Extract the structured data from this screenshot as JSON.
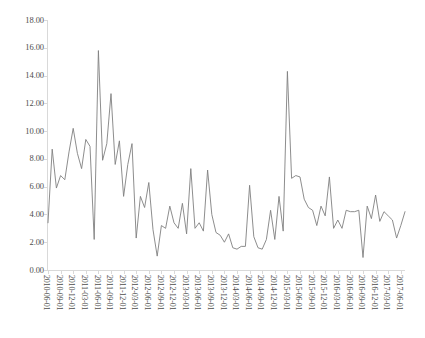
{
  "chart_data": {
    "type": "line",
    "title": "",
    "xlabel": "",
    "ylabel": "",
    "ylim": [
      0,
      18
    ],
    "ytick_step": 2,
    "ytick_labels": [
      "0.00",
      "2.00",
      "4.00",
      "6.00",
      "8.00",
      "10.00",
      "12.00",
      "14.00",
      "16.00",
      "18.00"
    ],
    "grid": false,
    "legend": "none",
    "line_color": "#808080",
    "axis_color": "#d9d9d9",
    "label_color": "#4d4d4d",
    "xtick_rotation": 90,
    "xtick_interval_months": 3,
    "x": [
      "2010-06-01",
      "2010-07-01",
      "2010-08-01",
      "2010-09-01",
      "2010-10-01",
      "2010-11-01",
      "2010-12-01",
      "2011-01-01",
      "2011-02-01",
      "2011-03-01",
      "2011-04-01",
      "2011-05-01",
      "2011-06-01",
      "2011-07-01",
      "2011-08-01",
      "2011-09-01",
      "2011-10-01",
      "2011-11-01",
      "2011-12-01",
      "2012-01-01",
      "2012-02-01",
      "2012-03-01",
      "2012-04-01",
      "2012-05-01",
      "2012-06-01",
      "2012-07-01",
      "2012-08-01",
      "2012-09-01",
      "2012-10-01",
      "2012-11-01",
      "2012-12-01",
      "2013-01-01",
      "2013-02-01",
      "2013-03-01",
      "2013-04-01",
      "2013-05-01",
      "2013-06-01",
      "2013-07-01",
      "2013-08-01",
      "2013-09-01",
      "2013-10-01",
      "2013-11-01",
      "2013-12-01",
      "2014-01-01",
      "2014-02-01",
      "2014-03-01",
      "2014-04-01",
      "2014-05-01",
      "2014-06-01",
      "2014-07-01",
      "2014-08-01",
      "2014-09-01",
      "2014-10-01",
      "2014-11-01",
      "2014-12-01",
      "2015-01-01",
      "2015-02-01",
      "2015-03-01",
      "2015-04-01",
      "2015-05-01",
      "2015-06-01",
      "2015-07-01",
      "2015-08-01",
      "2015-09-01",
      "2015-10-01",
      "2015-11-01",
      "2015-12-01",
      "2016-01-01",
      "2016-02-01",
      "2016-03-01",
      "2016-04-01",
      "2016-05-01",
      "2016-06-01",
      "2016-07-01",
      "2016-08-01",
      "2016-09-01",
      "2016-10-01",
      "2016-11-01",
      "2016-12-01",
      "2017-01-01",
      "2017-02-01",
      "2017-03-01",
      "2017-04-01",
      "2017-05-01",
      "2017-06-01",
      "2017-07-01"
    ],
    "xtick_labels": [
      "2010-06-01",
      "2010-09-01",
      "2010-12-01",
      "2011-03-01",
      "2011-06-01",
      "2011-09-01",
      "2011-12-01",
      "2012-03-01",
      "2012-06-01",
      "2012-09-01",
      "2012-12-01",
      "2013-03-01",
      "2013-06-01",
      "2013-09-01",
      "2013-12-01",
      "2014-03-01",
      "2014-06-01",
      "2014-09-01",
      "2014-12-01",
      "2015-03-01",
      "2015-06-01",
      "2015-09-01",
      "2015-12-01",
      "2016-03-01",
      "2016-06-01",
      "2016-09-01",
      "2016-12-01",
      "2017-03-01",
      "2017-06-01"
    ],
    "values": [
      3.4,
      8.7,
      5.9,
      6.8,
      6.5,
      8.5,
      10.2,
      8.4,
      7.3,
      9.4,
      8.9,
      2.2,
      15.8,
      7.9,
      9.1,
      12.7,
      7.6,
      9.3,
      5.3,
      7.6,
      9.1,
      2.3,
      5.3,
      4.5,
      6.3,
      2.9,
      1.0,
      3.2,
      3.0,
      4.6,
      3.4,
      3.0,
      4.8,
      2.6,
      7.3,
      3.0,
      3.4,
      2.8,
      7.2,
      4.0,
      2.7,
      2.5,
      2.0,
      2.6,
      1.6,
      1.5,
      1.7,
      1.7,
      6.1,
      2.4,
      1.6,
      1.5,
      2.2,
      4.3,
      2.2,
      5.3,
      2.8,
      14.3,
      6.6,
      6.8,
      6.7,
      5.1,
      4.5,
      4.3,
      3.2,
      4.6,
      3.9,
      6.7,
      3.0,
      3.6,
      3.0,
      4.3,
      4.2,
      4.2,
      4.3,
      0.9,
      4.6,
      3.7,
      5.4,
      3.5,
      4.2,
      3.9,
      3.6,
      2.3,
      3.2,
      4.2
    ]
  }
}
